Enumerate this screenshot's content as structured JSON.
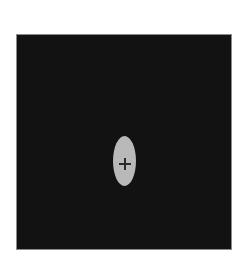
{
  "scene": {
    "background_color": "#ffffff",
    "field": {
      "color": "#121212",
      "border_color": "#8a8a8a"
    },
    "stimulus": {
      "shape": "ellipse",
      "orientation": "vertical",
      "color": "#b9b9b9"
    },
    "fixation": {
      "icon": "crosshair-icon",
      "color": "#2a2a2a"
    }
  }
}
